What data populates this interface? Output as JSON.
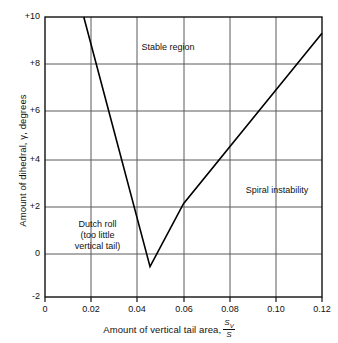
{
  "chart_data": {
    "type": "line",
    "title": "",
    "xlabel": "Amount of vertical tail area,",
    "xlabel_fraction_num": "S",
    "xlabel_fraction_num_sub": "V",
    "xlabel_fraction_den": "S",
    "ylabel": "Amount of dihedral, γ, degrees",
    "xlim": [
      0,
      0.12
    ],
    "ylim": [
      -2,
      10
    ],
    "xticks": [
      "0",
      "0.02",
      "0.04",
      "0.06",
      "0.08",
      "0.10",
      "0.12"
    ],
    "xtick_values": [
      0,
      0.02,
      0.04,
      0.06,
      0.08,
      0.1,
      0.12
    ],
    "yticks": [
      "+10",
      "+8",
      "+6",
      "+4",
      "+2",
      "0",
      "-2"
    ],
    "ytick_values": [
      10,
      8,
      6,
      4,
      2,
      0,
      -2
    ],
    "grid": true,
    "legend": "none",
    "series": [
      {
        "name": "stability boundary",
        "color": "#000000",
        "x": [
          0.0168,
          0.0455,
          0.06,
          0.12
        ],
        "y": [
          10.0,
          -0.7,
          2.0,
          9.3
        ]
      }
    ],
    "annotations": [
      {
        "text": "Stable region",
        "x": 0.0555,
        "y": 8.8
      },
      {
        "text": "Spiral instability",
        "x": 0.0925,
        "y": 3.1
      },
      {
        "text": "Dutch roll",
        "x": 0.0285,
        "y": 1.35
      },
      {
        "text": "(too little",
        "x": 0.0285,
        "y": 0.93
      },
      {
        "text": "vertical tail)",
        "x": 0.0285,
        "y": 0.51
      }
    ]
  },
  "colors": {
    "axis": "#111111",
    "grid": "#555555",
    "curve": "#000000",
    "background": "#ffffff"
  }
}
